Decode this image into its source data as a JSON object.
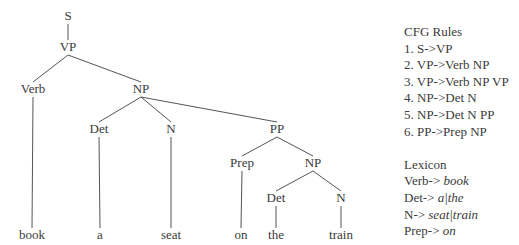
{
  "tree": {
    "nodes": [
      {
        "id": "S",
        "label": "S",
        "x": 68,
        "y": 20
      },
      {
        "id": "VP",
        "label": "VP",
        "x": 68,
        "y": 51
      },
      {
        "id": "Verb",
        "label": "Verb",
        "x": 33,
        "y": 93
      },
      {
        "id": "NP1",
        "label": "NP",
        "x": 141,
        "y": 93
      },
      {
        "id": "Det1",
        "label": "Det",
        "x": 99,
        "y": 133
      },
      {
        "id": "N1",
        "label": "N",
        "x": 171,
        "y": 133
      },
      {
        "id": "PP",
        "label": "PP",
        "x": 277,
        "y": 133
      },
      {
        "id": "Prep",
        "label": "Prep",
        "x": 242,
        "y": 167
      },
      {
        "id": "NP2",
        "label": "NP",
        "x": 313,
        "y": 167
      },
      {
        "id": "Det2",
        "label": "Det",
        "x": 276,
        "y": 202
      },
      {
        "id": "N2",
        "label": "N",
        "x": 341,
        "y": 202
      },
      {
        "id": "w1",
        "label": "book",
        "x": 32,
        "y": 239
      },
      {
        "id": "w2",
        "label": "a",
        "x": 100,
        "y": 239
      },
      {
        "id": "w3",
        "label": "seat",
        "x": 171,
        "y": 239
      },
      {
        "id": "w4",
        "label": "on",
        "x": 241,
        "y": 239
      },
      {
        "id": "w5",
        "label": "the",
        "x": 276,
        "y": 239
      },
      {
        "id": "w6",
        "label": "train",
        "x": 341,
        "y": 239
      }
    ],
    "edges": [
      [
        "S",
        "VP"
      ],
      [
        "VP",
        "Verb"
      ],
      [
        "VP",
        "NP1"
      ],
      [
        "NP1",
        "Det1"
      ],
      [
        "NP1",
        "N1"
      ],
      [
        "NP1",
        "PP"
      ],
      [
        "PP",
        "Prep"
      ],
      [
        "PP",
        "NP2"
      ],
      [
        "NP2",
        "Det2"
      ],
      [
        "NP2",
        "N2"
      ],
      [
        "Verb",
        "w1"
      ],
      [
        "Det1",
        "w2"
      ],
      [
        "N1",
        "w3"
      ],
      [
        "Prep",
        "w4"
      ],
      [
        "Det2",
        "w5"
      ],
      [
        "N2",
        "w6"
      ]
    ]
  },
  "cfg": {
    "title": "CFG Rules",
    "rules": [
      "1. S->VP",
      "2. VP->Verb NP",
      "3. VP->Verb NP VP",
      "4. NP->Det N",
      "5. NP->Det N PP",
      "6. PP->Prep NP"
    ]
  },
  "lexicon": {
    "title": "Lexicon",
    "entries": [
      {
        "lhs": "Verb-> ",
        "rhs": "book"
      },
      {
        "lhs": "Det-> ",
        "rhs": "a|the"
      },
      {
        "lhs": "N-> ",
        "rhs": "seat|train"
      },
      {
        "lhs": "Prep-> ",
        "rhs": "on"
      }
    ]
  }
}
